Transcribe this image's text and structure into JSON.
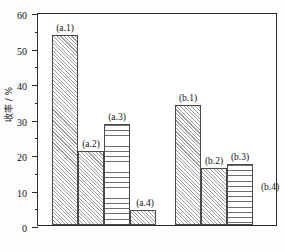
{
  "chart_data": {
    "type": "bar",
    "title": "",
    "xlabel": "",
    "ylabel": "收率 / %",
    "ylim": [
      0,
      60
    ],
    "ytick_labels": [
      "0",
      "10",
      "20",
      "30",
      "40",
      "50",
      "60"
    ],
    "ytick_values": [
      0,
      10,
      20,
      30,
      40,
      50,
      60
    ],
    "yminor_values": [
      5,
      15,
      25,
      35,
      45,
      55
    ],
    "grid": false,
    "legend": "none",
    "xtick_labels": [],
    "categories": [
      "(a.1)",
      "(a.2)",
      "(a.3)",
      "(a.4)",
      "(b.1)",
      "(b.2)",
      "(b.3)",
      "(b.4)"
    ],
    "values": [
      53.5,
      20.8,
      28.5,
      4.3,
      33.7,
      16.0,
      17.3,
      0.0
    ],
    "bars": [
      {
        "label": "(a.1)",
        "value": 53.5,
        "pattern": "diagonal-hatch",
        "group": "a"
      },
      {
        "label": "(a.2)",
        "value": 20.8,
        "pattern": "diagonal-hatch",
        "group": "a"
      },
      {
        "label": "(a.3)",
        "value": 28.5,
        "pattern": "horizontal-hatch",
        "group": "a"
      },
      {
        "label": "(a.4)",
        "value": 4.3,
        "pattern": "diagonal-hatch",
        "group": "a"
      },
      {
        "label": "(b.1)",
        "value": 33.7,
        "pattern": "diagonal-hatch",
        "group": "b"
      },
      {
        "label": "(b.2)",
        "value": 16.0,
        "pattern": "diagonal-hatch",
        "group": "b"
      },
      {
        "label": "(b.3)",
        "value": 17.3,
        "pattern": "horizontal-hatch",
        "group": "b"
      },
      {
        "label": "(b.4)",
        "value": 0.0,
        "pattern": "none",
        "group": "b"
      }
    ],
    "colors": {
      "axis": "#2b2b2b",
      "bar_edge": "#4a4a4a",
      "hatch": "#9a9a9a",
      "background": "#ffffff"
    }
  }
}
